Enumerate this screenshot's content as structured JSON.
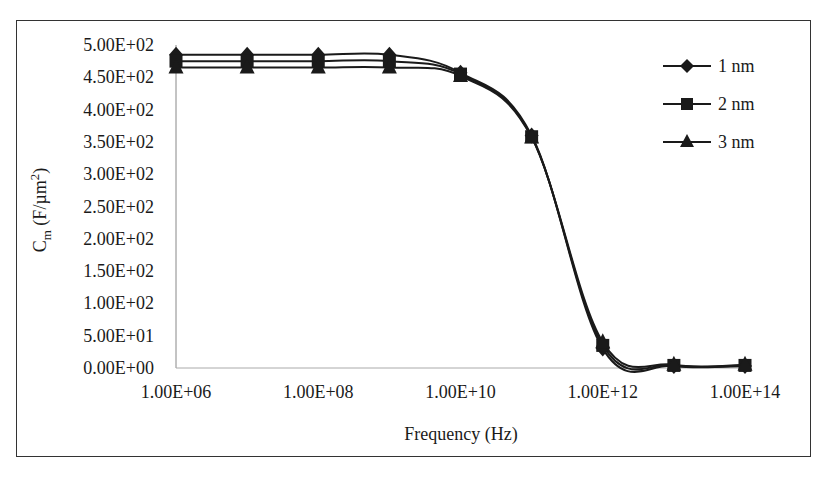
{
  "chart_data": {
    "type": "line",
    "title": "",
    "xlabel": "Frequency (Hz)",
    "ylabel": "C_m (F/µm²)",
    "ylabel_main": "C",
    "ylabel_sub": "m",
    "ylabel_rest": " (F/µm",
    "ylabel_sup": "2",
    "ylabel_close": ")",
    "x_scale": "log",
    "xlim": [
      1000000.0,
      100000000000000.0
    ],
    "ylim": [
      0,
      500
    ],
    "grid": false,
    "legend_position": "upper right",
    "x_tick_labels": [
      "1.00E+06",
      "1.00E+08",
      "1.00E+10",
      "1.00E+12",
      "1.00E+14"
    ],
    "y_tick_labels": [
      "0.00E+00",
      "5.00E+01",
      "1.00E+02",
      "1.50E+02",
      "2.00E+02",
      "2.50E+02",
      "3.00E+02",
      "3.50E+02",
      "4.00E+02",
      "4.50E+02",
      "5.00E+02"
    ],
    "x": [
      1000000.0,
      10000000.0,
      100000000.0,
      1000000000.0,
      10000000000.0,
      100000000000.0,
      1000000000000.0,
      10000000000000.0,
      100000000000000.0
    ],
    "series": [
      {
        "name": "1 nm",
        "marker": "diamond",
        "values": [
          485,
          485,
          485,
          485,
          457,
          360,
          30,
          3,
          3
        ]
      },
      {
        "name": "2 nm",
        "marker": "square",
        "values": [
          475,
          475,
          475,
          475,
          455,
          358,
          35,
          4,
          4
        ]
      },
      {
        "name": "3 nm",
        "marker": "triangle",
        "values": [
          465,
          465,
          465,
          465,
          452,
          357,
          40,
          5,
          5
        ]
      }
    ]
  },
  "colors": {
    "line": "#1a1a1a",
    "frame": "#333333",
    "axis": "#888888"
  }
}
